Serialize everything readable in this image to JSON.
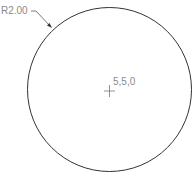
{
  "drawing": {
    "radius_label": "R2.00",
    "center_label": "5,5,0",
    "circle": {
      "cx": 109.5,
      "cy": 89.5,
      "r": 82,
      "stroke": "#333333"
    },
    "label_color": "#8a8a8a"
  }
}
